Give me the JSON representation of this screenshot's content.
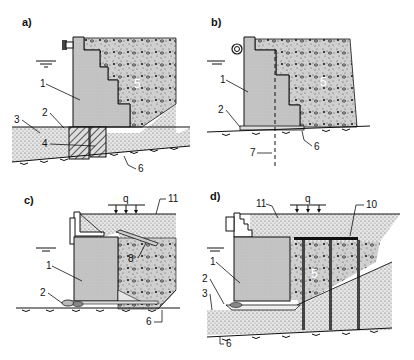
{
  "figure": {
    "colors": {
      "wall": "#c8c8c8",
      "backfill": "#bdbdbd",
      "soil": "#e2e2e2",
      "line": "#111111",
      "background": "#ffffff"
    },
    "panels": [
      {
        "id": "a",
        "label": "a)",
        "callouts": [
          "1",
          "2",
          "3",
          "4",
          "5",
          "6"
        ]
      },
      {
        "id": "b",
        "label": "b)",
        "callouts": [
          "1",
          "2",
          "5",
          "6",
          "7"
        ]
      },
      {
        "id": "c",
        "label": "c)",
        "load_label": "q",
        "callouts": [
          "1",
          "2",
          "6",
          "8",
          "11"
        ]
      },
      {
        "id": "d",
        "label": "d)",
        "load_label": "q",
        "callouts": [
          "1",
          "2",
          "3",
          "5",
          "6",
          "10",
          "11"
        ]
      }
    ]
  }
}
